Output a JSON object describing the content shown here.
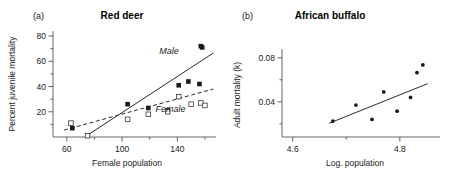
{
  "figure": {
    "background": "#ffffff",
    "ink_color": "#1a1a1a"
  },
  "chart_data": [
    {
      "type": "scatter",
      "panel_label": "(a)",
      "title": "Red deer",
      "xlabel": "Female population",
      "ylabel": "Percent juvenile mortality",
      "xlim": [
        50,
        168
      ],
      "ylim": [
        0,
        84
      ],
      "xticks_major": [
        60,
        100,
        140
      ],
      "xticks_major_labels": [
        "60",
        "100",
        "140"
      ],
      "xticks_minor": [
        80,
        120,
        160
      ],
      "yticks_major": [
        20,
        40,
        60,
        80
      ],
      "yticks_major_labels": [
        "20",
        "40",
        "60",
        "80"
      ],
      "yticks_minor": [
        10,
        30,
        50,
        70
      ],
      "grid": false,
      "legend_position": "inline-annotations",
      "series": [
        {
          "name": "Male",
          "marker": "filled-square",
          "fit_style": "solid",
          "label_text": "Male",
          "label_x": 134,
          "label_y": 66,
          "x": [
            64,
            75,
            104,
            119,
            133,
            141,
            148,
            156,
            158,
            157
          ],
          "y": [
            7,
            1,
            26,
            23,
            21,
            41,
            44,
            42,
            71,
            72
          ],
          "fit_x": [
            75,
            166
          ],
          "fit_y": [
            1.5,
            66.5
          ]
        },
        {
          "name": "Female",
          "marker": "open-square",
          "fit_style": "dashed",
          "label_text": "Female",
          "label_x": 135,
          "label_y": 20,
          "x": [
            63,
            75,
            104,
            119,
            133,
            141,
            150,
            157,
            160
          ],
          "y": [
            11,
            1,
            14,
            18,
            20,
            32,
            26,
            27,
            25
          ],
          "fit_x": [
            58,
            166
          ],
          "fit_y": [
            5.5,
            38.0
          ]
        }
      ]
    },
    {
      "type": "scatter",
      "panel_label": "(b)",
      "title": "African buffalo",
      "xlabel": "Log. population",
      "ylabel": "Adult mortality (k)",
      "ylabel_italic_part": "k",
      "xlim": [
        4.58,
        4.875
      ],
      "ylim": [
        0.008,
        0.088
      ],
      "xticks_major": [
        4.6,
        4.8
      ],
      "xticks_major_labels": [
        "4.6",
        "4.8"
      ],
      "xticks_minor": [
        4.7
      ],
      "yticks_major": [
        0.04,
        0.08
      ],
      "yticks_major_labels": [
        "0.04",
        "0.08"
      ],
      "yticks_minor": [
        0.02,
        0.06
      ],
      "grid": false,
      "legend_position": "none",
      "series": [
        {
          "name": "Adult mortality",
          "marker": "filled-dot",
          "fit_style": "solid",
          "x": [
            4.675,
            4.718,
            4.748,
            4.77,
            4.795,
            4.82,
            4.832,
            4.843
          ],
          "y": [
            0.0225,
            0.037,
            0.024,
            0.049,
            0.0315,
            0.044,
            0.0665,
            0.0735
          ],
          "fit_x": [
            4.668,
            4.852
          ],
          "fit_y": [
            0.0205,
            0.0565
          ]
        }
      ]
    }
  ]
}
